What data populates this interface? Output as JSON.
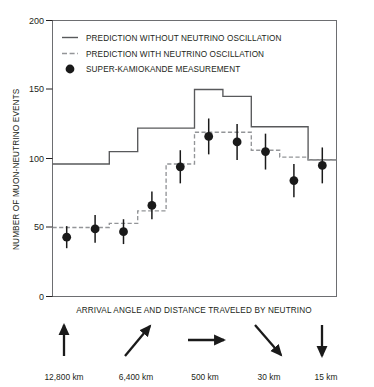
{
  "figure": {
    "y_axis_title": "NUMBER OF MUON-NEUTRINO EVENTS",
    "x_axis_title": "ARRIVAL ANGLE AND DISTANCE TRAVELED BY NEUTRINO"
  },
  "legend": {
    "items": [
      {
        "key": "solid-line",
        "label": "PREDICTION WITHOUT NEUTRINO OSCILLATION"
      },
      {
        "key": "dashed-line",
        "label": "PREDICTION WITH NEUTRINO OSCILLATION"
      },
      {
        "key": "filled-circle",
        "label": "SUPER-KAMIOKANDE MEASUREMENT"
      }
    ]
  },
  "y_ticks": [
    "0",
    "50",
    "100",
    "150",
    "200"
  ],
  "distance_markers": [
    {
      "arrow": "arrow-up",
      "label": "12,800 km"
    },
    {
      "arrow": "arrow-up-right",
      "label": "6,400 km"
    },
    {
      "arrow": "arrow-right",
      "label": "500 km"
    },
    {
      "arrow": "arrow-down-right",
      "label": "30 km"
    },
    {
      "arrow": "arrow-down",
      "label": "15 km"
    }
  ],
  "colors": {
    "ink": "#231f20",
    "frame": "#6d6e71",
    "solid_line": "#58595b",
    "dashed_line": "#939598",
    "marker": "#1a1a1a"
  },
  "chart_data": {
    "type": "line",
    "title": "",
    "xlabel": "ARRIVAL ANGLE AND DISTANCE TRAVELED BY NEUTRINO",
    "ylabel": "NUMBER OF MUON-NEUTRINO EVENTS",
    "ylim": [
      0,
      200
    ],
    "xlim": [
      0,
      10
    ],
    "grid": false,
    "legend_position": "top-left-inside",
    "bin_edges": [
      0,
      1,
      2,
      3,
      4,
      5,
      6,
      7,
      8,
      9,
      10
    ],
    "x_tick_labels": [
      "12,800 km",
      "6,400 km",
      "500 km",
      "30 km",
      "15 km"
    ],
    "series": [
      {
        "name": "PREDICTION WITHOUT NEUTRINO OSCILLATION",
        "style": "step-solid",
        "values": [
          96,
          96,
          105,
          122,
          122,
          150,
          145,
          123,
          123,
          99
        ]
      },
      {
        "name": "PREDICTION WITH NEUTRINO OSCILLATION",
        "style": "step-dashed",
        "values": [
          50,
          50,
          53,
          62,
          96,
          119,
          119,
          106,
          101,
          99
        ]
      },
      {
        "name": "SUPER-KAMIOKANDE MEASUREMENT",
        "style": "points-with-error-bars",
        "x": [
          0.5,
          1.5,
          2.5,
          3.5,
          4.5,
          5.5,
          6.5,
          7.5,
          8.5,
          9.5
        ],
        "values": [
          43,
          49,
          47,
          66,
          94,
          116,
          112,
          105,
          84,
          95
        ],
        "errors": [
          8,
          10,
          9,
          10,
          12,
          13,
          13,
          13,
          12,
          13
        ]
      }
    ]
  }
}
